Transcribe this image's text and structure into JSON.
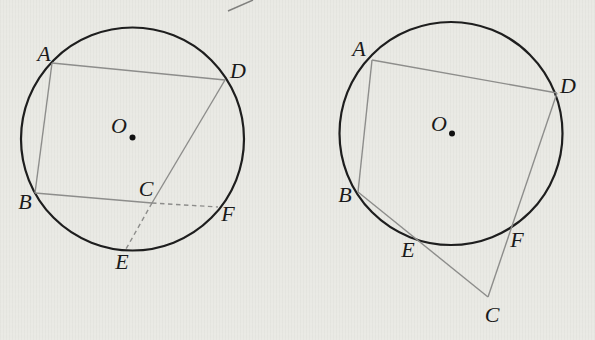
{
  "figure": {
    "style": {
      "background_color": "#e9e9e4",
      "circle_color": "#1e1e1e",
      "circle_stroke_width": 2.2,
      "line_color": "#8d8d8b",
      "line_stroke_width": 1.4,
      "dash_pattern": "4.5 3.5",
      "label_color": "#1a1a1a",
      "center_dot_radius": 3,
      "center_dot_color": "#111111"
    },
    "diagrams": [
      {
        "name": "left-figure",
        "circle": {
          "cx": 132.5,
          "cy": 139,
          "r": 111.5
        },
        "center": {
          "label": "O",
          "label_x": 119,
          "label_y": 133,
          "dot_x": 132.5,
          "dot_y": 137.5
        },
        "points": [
          {
            "label": "A",
            "x": 52,
            "y": 63,
            "label_x": 44,
            "label_y": 61
          },
          {
            "label": "B",
            "x": 35,
            "y": 193,
            "label_x": 25,
            "label_y": 209
          },
          {
            "label": "C",
            "x": 152,
            "y": 203,
            "label_x": 146,
            "label_y": 196
          },
          {
            "label": "D",
            "x": 225,
            "y": 80,
            "label_x": 238,
            "label_y": 78
          },
          {
            "label": "E",
            "x": 126,
            "y": 249,
            "label_x": 122,
            "label_y": 269
          },
          {
            "label": "F",
            "x": 218,
            "y": 207,
            "label_x": 228,
            "label_y": 221
          }
        ],
        "solid_edges": [
          [
            "A",
            "D"
          ],
          [
            "A",
            "B"
          ],
          [
            "B",
            "C"
          ],
          [
            "D",
            "C"
          ]
        ],
        "dashed_edges": [
          [
            "C",
            "F"
          ],
          [
            "C",
            "E"
          ]
        ]
      },
      {
        "name": "right-figure",
        "circle": {
          "cx": 451,
          "cy": 133.5,
          "r": 111.5
        },
        "center": {
          "label": "O",
          "label_x": 439,
          "label_y": 131,
          "dot_x": 452,
          "dot_y": 133.5
        },
        "points": [
          {
            "label": "A",
            "x": 372,
            "y": 60,
            "label_x": 359,
            "label_y": 56
          },
          {
            "label": "B",
            "x": 358,
            "y": 192,
            "label_x": 345,
            "label_y": 202
          },
          {
            "label": "C",
            "x": 488,
            "y": 297,
            "label_x": 492,
            "label_y": 322
          },
          {
            "label": "D",
            "x": 557,
            "y": 93,
            "label_x": 568,
            "label_y": 93
          },
          {
            "label": "E",
            "x": 414,
            "y": 237,
            "label_x": 408,
            "label_y": 257
          },
          {
            "label": "F",
            "x": 509,
            "y": 228,
            "label_x": 517,
            "label_y": 247
          }
        ],
        "solid_edges": [
          [
            "A",
            "D"
          ],
          [
            "A",
            "B"
          ],
          [
            "B",
            "C"
          ],
          [
            "D",
            "C"
          ]
        ],
        "dashed_edges": []
      }
    ],
    "stray_mark": {
      "x1": 228,
      "y1": 11,
      "x2": 253,
      "y2": 0,
      "color": "#3c3c3c",
      "opacity": 0.6
    }
  }
}
